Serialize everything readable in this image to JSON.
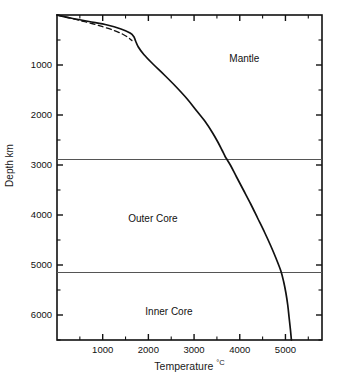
{
  "chart_data": {
    "type": "line",
    "title": "",
    "xlabel": "Temperature",
    "xunits": "°C",
    "ylabel": "Depth km",
    "xlim": [
      0,
      5800
    ],
    "ylim": [
      0,
      6500
    ],
    "y_inverted": true,
    "grid": false,
    "legend": "none",
    "x_ticks": [
      1000,
      2000,
      3000,
      4000,
      5000
    ],
    "x_tick_labels": [
      "1000",
      "2000",
      "3000",
      "4000",
      "5000"
    ],
    "x_minor_ticks": [
      500,
      1500,
      2500,
      3500,
      4500,
      5500
    ],
    "y_ticks": [
      1000,
      2000,
      3000,
      4000,
      5000,
      6000
    ],
    "y_tick_labels": [
      "1000",
      "2000",
      "3000",
      "4000",
      "5000",
      "6000"
    ],
    "y_minor_ticks": [
      500,
      1500,
      2500,
      3500,
      4500,
      5500,
      6500
    ],
    "series": [
      {
        "name": "geotherm",
        "style": "solid",
        "points": [
          [
            0,
            0
          ],
          [
            300,
            60
          ],
          [
            700,
            130
          ],
          [
            1100,
            200
          ],
          [
            1400,
            280
          ],
          [
            1600,
            360
          ],
          [
            1680,
            430
          ],
          [
            1720,
            520
          ],
          [
            1780,
            640
          ],
          [
            1900,
            790
          ],
          [
            2100,
            980
          ],
          [
            2350,
            1200
          ],
          [
            2600,
            1430
          ],
          [
            2850,
            1680
          ],
          [
            3050,
            1910
          ],
          [
            3250,
            2140
          ],
          [
            3400,
            2350
          ],
          [
            3520,
            2540
          ],
          [
            3610,
            2700
          ],
          [
            3680,
            2830
          ],
          [
            3720,
            2890
          ],
          [
            3800,
            3010
          ],
          [
            3930,
            3240
          ],
          [
            4080,
            3500
          ],
          [
            4240,
            3780
          ],
          [
            4390,
            4060
          ],
          [
            4540,
            4340
          ],
          [
            4680,
            4620
          ],
          [
            4800,
            4880
          ],
          [
            4900,
            5120
          ],
          [
            4960,
            5330
          ],
          [
            5010,
            5560
          ],
          [
            5050,
            5800
          ],
          [
            5080,
            6050
          ],
          [
            5110,
            6300
          ],
          [
            5130,
            6500
          ]
        ]
      },
      {
        "name": "alternative-geotherm-dashed",
        "style": "dashed",
        "points": [
          [
            0,
            0
          ],
          [
            260,
            55
          ],
          [
            520,
            115
          ],
          [
            780,
            175
          ],
          [
            1020,
            240
          ],
          [
            1250,
            310
          ],
          [
            1430,
            380
          ],
          [
            1560,
            450
          ],
          [
            1640,
            510
          ]
        ]
      }
    ],
    "boundaries": [
      {
        "name": "core-mantle-boundary",
        "depth": 2890
      },
      {
        "name": "inner-core-boundary",
        "depth": 5150
      }
    ],
    "regions": [
      {
        "name": "Mantle",
        "label": "Mantle",
        "x": 4100,
        "y": 900
      },
      {
        "name": "Outer Core",
        "label": "Outer Core",
        "x": 2100,
        "y": 4100
      },
      {
        "name": "Inner Core",
        "label": "Inner Core",
        "x": 2450,
        "y": 5950
      }
    ]
  }
}
